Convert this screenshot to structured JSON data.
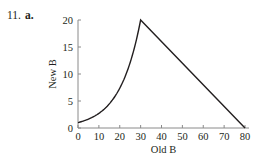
{
  "problem": {
    "number": "11.",
    "part": "a."
  },
  "chart_data": {
    "type": "line",
    "title": "",
    "xlabel": "Old B",
    "ylabel": "New B",
    "xlim": [
      0,
      80
    ],
    "ylim": [
      0,
      20
    ],
    "xticks": [
      0,
      10,
      20,
      30,
      40,
      50,
      60,
      70,
      80
    ],
    "yticks": [
      0,
      5,
      10,
      15,
      20
    ],
    "grid": false,
    "legend": null,
    "series": [
      {
        "name": "New B vs Old B",
        "x": [
          0,
          5,
          10,
          15,
          20,
          25,
          30,
          40,
          50,
          60,
          70,
          80
        ],
        "y": [
          1,
          1.6,
          2.7,
          4.3,
          7,
          11.5,
          20,
          16,
          12,
          8,
          4,
          0
        ]
      }
    ]
  }
}
